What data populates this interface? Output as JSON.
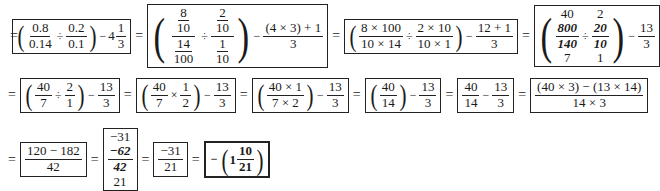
{
  "row1": {
    "s1": {
      "a_num": "0.8",
      "a_den": "0.14",
      "div": "÷",
      "b_num": "0.2",
      "b_den": "0.1",
      "minus": "−",
      "whole": "4",
      "c_num": "1",
      "c_den": "3"
    },
    "eq": "=",
    "s2": {
      "a_nn": "8",
      "a_nd": "10",
      "a_dn": "14",
      "a_dd": "100",
      "div": "÷",
      "b_nn": "2",
      "b_nd": "10",
      "b_dn": "1",
      "b_dd": "10",
      "minus": "−",
      "c_num": "(4 × 3) + 1",
      "c_den": "3"
    },
    "s3": {
      "a_num": "8 × 100",
      "a_den": "10 × 14",
      "div": "÷",
      "b_num": "2 × 10",
      "b_den": "10 × 1",
      "minus": "−",
      "c_num": "12 + 1",
      "c_den": "3"
    },
    "s4": {
      "a_top": "40",
      "a_num": "800",
      "a_den": "140",
      "a_bot": "7",
      "div": "÷",
      "b_top": "2",
      "b_num": "20",
      "b_den": "10",
      "b_bot": "1",
      "minus": "−",
      "c_num": "13",
      "c_den": "3"
    }
  },
  "row2": {
    "s5": {
      "a_num": "40",
      "a_den": "7",
      "div": "÷",
      "b_num": "2",
      "b_den": "1",
      "minus": "−",
      "c_num": "13",
      "c_den": "3"
    },
    "s6": {
      "a_num": "40",
      "a_den": "7",
      "mul": "×",
      "b_num": "1",
      "b_den": "2",
      "minus": "−",
      "c_num": "13",
      "c_den": "3"
    },
    "s7": {
      "a_num": "40 × 1",
      "a_den": "7 × 2",
      "minus": "−",
      "c_num": "13",
      "c_den": "3"
    },
    "s8": {
      "a_num": "40",
      "a_den": "14",
      "minus": "−",
      "c_num": "13",
      "c_den": "3"
    },
    "s9": {
      "a_num": "40",
      "a_den": "14",
      "minus": "−",
      "c_num": "13",
      "c_den": "3"
    },
    "s10": {
      "num": "(40 × 3) − (13 × 14)",
      "den": "14 × 3"
    }
  },
  "row3": {
    "s11": {
      "num": "120 − 182",
      "den": "42"
    },
    "s12": {
      "top": "−31",
      "num": "−62",
      "den": "42",
      "bot": "21"
    },
    "s13": {
      "num": "−31",
      "den": "21"
    },
    "s14": {
      "minus": "−",
      "whole": "1",
      "num": "10",
      "den": "21"
    }
  },
  "eq": "="
}
